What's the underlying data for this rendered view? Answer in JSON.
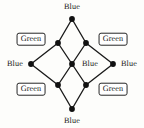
{
  "figure": {
    "name": "star-graph-diagram",
    "background_color": "#fdfdfb",
    "edge_color": "#1a1a1a",
    "node_color": "#111111",
    "label_text_color": "#1a1a1a",
    "label_box_color": "#262626"
  },
  "nodes": [
    {
      "id": "top-outer",
      "label": "Blue",
      "boxed": false,
      "cx": 72,
      "cy": 19,
      "label_x": 72,
      "label_y": 7
    },
    {
      "id": "left-outer",
      "label": "Blue",
      "boxed": false,
      "cx": 31,
      "cy": 64,
      "label_x": 15,
      "label_y": 64
    },
    {
      "id": "right-outer",
      "label": "Blue",
      "boxed": false,
      "cx": 113,
      "cy": 64,
      "label_x": 129,
      "label_y": 64
    },
    {
      "id": "bottom-outer",
      "label": "Blue",
      "boxed": false,
      "cx": 72,
      "cy": 109,
      "label_x": 72,
      "label_y": 121
    },
    {
      "id": "center",
      "label": "Blue",
      "boxed": false,
      "cx": 72,
      "cy": 64,
      "label_x": 90,
      "label_y": 64
    },
    {
      "id": "top-left-inner",
      "label": "Green",
      "boxed": true,
      "cx": 58,
      "cy": 43,
      "label_x": 31,
      "label_y": 39
    },
    {
      "id": "top-right-inner",
      "label": "Green",
      "boxed": true,
      "cx": 86,
      "cy": 43,
      "label_x": 113,
      "label_y": 39
    },
    {
      "id": "bottom-left-inner",
      "label": "Green",
      "boxed": true,
      "cx": 58,
      "cy": 85,
      "label_x": 31,
      "label_y": 89
    },
    {
      "id": "bottom-right-inner",
      "label": "Green",
      "boxed": true,
      "cx": 86,
      "cy": 85,
      "label_x": 113,
      "label_y": 89
    }
  ],
  "edges": [
    {
      "from": "top-outer",
      "to": "top-left-inner"
    },
    {
      "from": "top-outer",
      "to": "top-right-inner"
    },
    {
      "from": "left-outer",
      "to": "top-left-inner"
    },
    {
      "from": "left-outer",
      "to": "bottom-left-inner"
    },
    {
      "from": "right-outer",
      "to": "top-right-inner"
    },
    {
      "from": "right-outer",
      "to": "bottom-right-inner"
    },
    {
      "from": "bottom-outer",
      "to": "bottom-left-inner"
    },
    {
      "from": "bottom-outer",
      "to": "bottom-right-inner"
    },
    {
      "from": "center",
      "to": "top-left-inner"
    },
    {
      "from": "center",
      "to": "top-right-inner"
    },
    {
      "from": "center",
      "to": "bottom-left-inner"
    },
    {
      "from": "center",
      "to": "bottom-right-inner"
    }
  ]
}
